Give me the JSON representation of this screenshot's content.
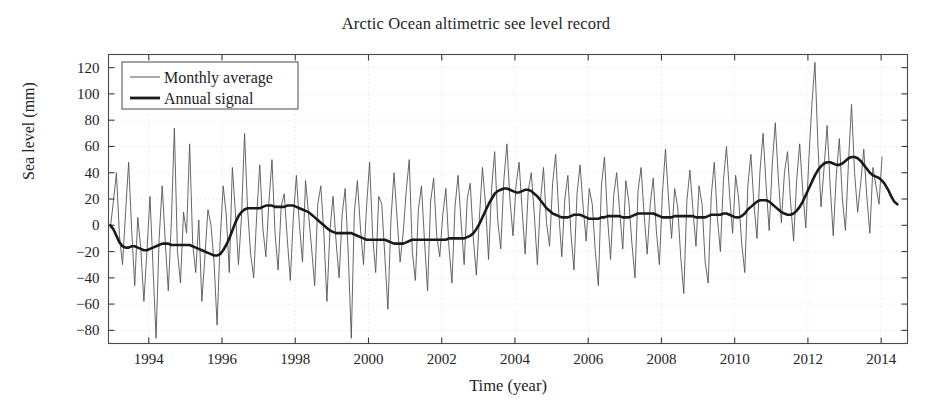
{
  "figure": {
    "title": "Arctic Ocean altimetric see level record",
    "background": "#ffffff"
  },
  "axes": {
    "xlabel": "Time (year)",
    "ylabel": "Sea level (mm)",
    "x_ticks": [
      "1994",
      "1996",
      "1998",
      "2000",
      "2002",
      "2004",
      "2006",
      "2008",
      "2010",
      "2012",
      "2014"
    ],
    "y_ticks": [
      "120",
      "100",
      "80",
      "60",
      "40",
      "20",
      "0",
      "−20",
      "−40",
      "−60",
      "−80"
    ],
    "grid": "dotted-faint",
    "frame_color": "#4a4a4a"
  },
  "legend": {
    "position": "top-left",
    "entries": [
      {
        "label": "Monthly average",
        "style": "thin",
        "color": "#555555"
      },
      {
        "label": "Annual signal",
        "style": "thick",
        "color": "#1a1a1a"
      }
    ]
  },
  "chart_data": {
    "type": "line",
    "title": "Arctic Ocean altimetric see level record",
    "xlabel": "Time (year)",
    "ylabel": "Sea level (mm)",
    "xlim": [
      1993.0,
      1993.0
    ],
    "x_range": [
      1992.9,
      1994.0
    ],
    "ylim": [
      -90,
      130
    ],
    "x_tick_values": [
      1994,
      1996,
      1998,
      2000,
      2002,
      2004,
      2006,
      2008,
      2010,
      2012,
      2014
    ],
    "y_tick_values": [
      120,
      100,
      80,
      60,
      40,
      20,
      0,
      -20,
      -40,
      -60,
      -80
    ],
    "grid": true,
    "legend_position": "upper left",
    "series": [
      {
        "name": "Monthly average",
        "color": "#555555",
        "width": 0.9,
        "x_start": 1992.95,
        "x_step": 0.0833,
        "values": [
          -2,
          18,
          40,
          -8,
          -30,
          10,
          48,
          -4,
          -46,
          6,
          -18,
          -58,
          -20,
          22,
          -32,
          -86,
          -10,
          30,
          -12,
          -50,
          2,
          74,
          -20,
          -44,
          10,
          -6,
          62,
          -14,
          -36,
          4,
          -58,
          -24,
          12,
          0,
          -28,
          -76,
          -12,
          30,
          8,
          -36,
          44,
          10,
          -30,
          6,
          70,
          12,
          -22,
          -40,
          8,
          46,
          -2,
          -24,
          18,
          50,
          -6,
          -34,
          14,
          24,
          -10,
          -42,
          6,
          38,
          0,
          -28,
          34,
          8,
          -18,
          -46,
          16,
          30,
          -6,
          -58,
          -4,
          22,
          -12,
          -40,
          8,
          28,
          -22,
          -86,
          10,
          34,
          -2,
          -30,
          14,
          48,
          -8,
          -36,
          22,
          16,
          -24,
          -64,
          4,
          40,
          6,
          -28,
          -6,
          26,
          50,
          -20,
          -42,
          12,
          30,
          -12,
          -50,
          18,
          36,
          -8,
          -24,
          8,
          28,
          -16,
          -44,
          14,
          38,
          2,
          -30,
          20,
          32,
          -10,
          -38,
          6,
          44,
          16,
          -26,
          28,
          56,
          4,
          -18,
          34,
          62,
          20,
          -8,
          30,
          48,
          12,
          -22,
          26,
          40,
          8,
          -30,
          18,
          44,
          2,
          -16,
          32,
          54,
          10,
          -24,
          20,
          38,
          -6,
          -34,
          24,
          46,
          14,
          -12,
          28,
          16,
          -20,
          -46,
          30,
          52,
          6,
          -26,
          22,
          40,
          10,
          -18,
          34,
          18,
          -14,
          -40,
          26,
          44,
          8,
          -22,
          16,
          36,
          -4,
          -30,
          24,
          58,
          20,
          -10,
          28,
          14,
          -24,
          -52,
          18,
          42,
          12,
          -16,
          30,
          16,
          -28,
          -44,
          22,
          48,
          6,
          -20,
          34,
          60,
          24,
          -6,
          38,
          20,
          -14,
          -36,
          30,
          54,
          16,
          -10,
          42,
          70,
          30,
          -4,
          46,
          78,
          36,
          2,
          40,
          56,
          18,
          -12,
          34,
          62,
          26,
          -2,
          50,
          92,
          124,
          60,
          14,
          44,
          76,
          30,
          -8,
          38,
          66,
          20,
          -4,
          48,
          92,
          40,
          10,
          32,
          58,
          22,
          -6,
          44,
          30,
          16,
          52
        ]
      },
      {
        "name": "Annual signal",
        "color": "#1a1a1a",
        "width": 2.6,
        "x_start": 1992.95,
        "x_step": 0.0833,
        "values": [
          0,
          -3,
          -8,
          -13,
          -16,
          -17,
          -17,
          -16,
          -16,
          -17,
          -18,
          -19,
          -19,
          -18,
          -17,
          -16,
          -15,
          -14,
          -14,
          -14,
          -15,
          -15,
          -15,
          -15,
          -15,
          -15,
          -15,
          -16,
          -17,
          -18,
          -19,
          -20,
          -21,
          -22,
          -23,
          -23,
          -22,
          -19,
          -15,
          -10,
          -4,
          2,
          7,
          10,
          12,
          13,
          13,
          13,
          13,
          13,
          14,
          15,
          15,
          15,
          14,
          14,
          14,
          14,
          15,
          15,
          15,
          14,
          13,
          12,
          11,
          10,
          8,
          6,
          4,
          2,
          0,
          -2,
          -4,
          -5,
          -6,
          -6,
          -6,
          -6,
          -6,
          -6,
          -7,
          -8,
          -9,
          -10,
          -11,
          -11,
          -11,
          -11,
          -11,
          -11,
          -11,
          -12,
          -13,
          -14,
          -14,
          -14,
          -14,
          -13,
          -12,
          -11,
          -11,
          -11,
          -11,
          -11,
          -11,
          -11,
          -11,
          -11,
          -11,
          -11,
          -11,
          -10,
          -10,
          -10,
          -10,
          -10,
          -10,
          -9,
          -8,
          -6,
          -3,
          1,
          6,
          11,
          16,
          20,
          24,
          26,
          27,
          28,
          28,
          27,
          26,
          25,
          25,
          26,
          27,
          27,
          26,
          24,
          22,
          19,
          16,
          13,
          11,
          9,
          8,
          7,
          6,
          6,
          6,
          7,
          8,
          8,
          8,
          7,
          6,
          5,
          5,
          5,
          5,
          6,
          6,
          7,
          7,
          7,
          7,
          7,
          6,
          6,
          6,
          7,
          8,
          9,
          9,
          9,
          9,
          9,
          9,
          8,
          7,
          6,
          6,
          6,
          6,
          7,
          7,
          7,
          7,
          7,
          7,
          7,
          6,
          6,
          6,
          6,
          7,
          8,
          8,
          8,
          8,
          9,
          9,
          8,
          7,
          6,
          6,
          7,
          9,
          12,
          14,
          16,
          18,
          19,
          19,
          19,
          18,
          16,
          14,
          12,
          10,
          9,
          8,
          8,
          9,
          11,
          14,
          18,
          23,
          28,
          33,
          38,
          42,
          45,
          47,
          48,
          48,
          47,
          46,
          46,
          47,
          49,
          51,
          52,
          52,
          51,
          49,
          46,
          43,
          40,
          38,
          37,
          36,
          34,
          31,
          27,
          22,
          18,
          16
        ]
      }
    ]
  }
}
